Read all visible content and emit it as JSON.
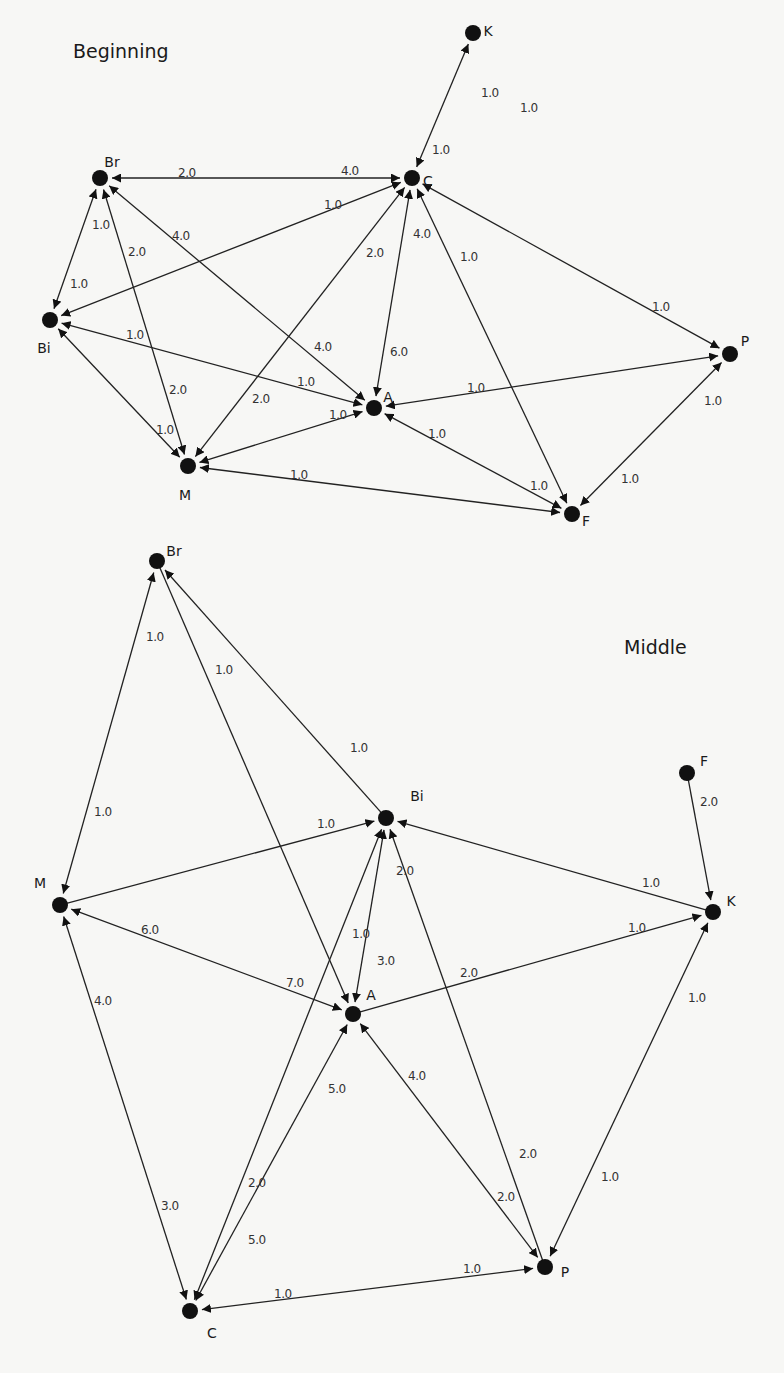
{
  "colors": {
    "background": "#f7f7f5",
    "node": "#111111",
    "edge": "#222222",
    "text": "#1a1a1a"
  },
  "graphs": [
    {
      "title": "Beginning",
      "title_pos": [
        73,
        58
      ],
      "nodes": [
        {
          "id": "K",
          "x": 473,
          "y": 33,
          "lx": 488,
          "ly": 36
        },
        {
          "id": "C",
          "x": 412,
          "y": 178,
          "lx": 428,
          "ly": 186
        },
        {
          "id": "Br",
          "x": 100,
          "y": 178,
          "lx": 112,
          "ly": 167
        },
        {
          "id": "Bi",
          "x": 50,
          "y": 320,
          "lx": 44,
          "ly": 353
        },
        {
          "id": "A",
          "x": 374,
          "y": 408,
          "lx": 388,
          "ly": 402
        },
        {
          "id": "M",
          "x": 188,
          "y": 466,
          "lx": 185,
          "ly": 500
        },
        {
          "id": "P",
          "x": 730,
          "y": 354,
          "lx": 745,
          "ly": 346
        },
        {
          "id": "F",
          "x": 572,
          "y": 514,
          "lx": 586,
          "ly": 526
        }
      ],
      "edges": [
        {
          "from": "C",
          "to": "K",
          "arrowFrom": true,
          "arrowTo": true,
          "labels": [
            {
              "text": "1.0",
              "x": 481,
              "y": 93
            },
            {
              "text": "1.0",
              "x": 432,
              "y": 150
            }
          ]
        },
        {
          "from": "Br",
          "to": "C",
          "arrowFrom": true,
          "arrowTo": true,
          "labels": [
            {
              "text": "2.0",
              "x": 178,
              "y": 173
            },
            {
              "text": "4.0",
              "x": 341,
              "y": 171
            }
          ]
        },
        {
          "from": "Bi",
          "to": "C",
          "arrowFrom": true,
          "arrowTo": true,
          "labels": [
            {
              "text": "1.0",
              "x": 324,
              "y": 205
            }
          ]
        },
        {
          "from": "Bi",
          "to": "Br",
          "arrowFrom": true,
          "arrowTo": true,
          "labels": [
            {
              "text": "1.0",
              "x": 92,
              "y": 225
            },
            {
              "text": "1.0",
              "x": 70,
              "y": 284
            }
          ]
        },
        {
          "from": "M",
          "to": "Br",
          "arrowFrom": true,
          "arrowTo": true,
          "labels": [
            {
              "text": "2.0",
              "x": 128,
              "y": 252
            },
            {
              "text": "2.0",
              "x": 169,
              "y": 390
            }
          ]
        },
        {
          "from": "A",
          "to": "Br",
          "arrowFrom": true,
          "arrowTo": true,
          "labels": [
            {
              "text": "4.0",
              "x": 172,
              "y": 236
            },
            {
              "text": "4.0",
              "x": 314,
              "y": 347
            }
          ]
        },
        {
          "from": "A",
          "to": "Bi",
          "arrowFrom": true,
          "arrowTo": true,
          "labels": [
            {
              "text": "1.0",
              "x": 126,
              "y": 335
            },
            {
              "text": "1.0",
              "x": 297,
              "y": 382
            }
          ]
        },
        {
          "from": "M",
          "to": "Bi",
          "arrowFrom": true,
          "arrowTo": true,
          "labels": [
            {
              "text": "1.0",
              "x": 156,
              "y": 430
            }
          ]
        },
        {
          "from": "M",
          "to": "C",
          "arrowFrom": true,
          "arrowTo": true,
          "labels": [
            {
              "text": "2.0",
              "x": 366,
              "y": 253
            },
            {
              "text": "2.0",
              "x": 252,
              "y": 399
            }
          ]
        },
        {
          "from": "A",
          "to": "C",
          "arrowFrom": true,
          "arrowTo": true,
          "labels": [
            {
              "text": "4.0",
              "x": 413,
              "y": 234
            },
            {
              "text": "6.0",
              "x": 390,
              "y": 352
            }
          ]
        },
        {
          "from": "C",
          "to": "F",
          "arrowFrom": true,
          "arrowTo": true,
          "labels": [
            {
              "text": "1.0",
              "x": 460,
              "y": 257
            }
          ]
        },
        {
          "from": "C",
          "to": "P",
          "arrowFrom": true,
          "arrowTo": true,
          "labels": [
            {
              "text": "1.0",
              "x": 652,
              "y": 307
            }
          ]
        },
        {
          "from": "M",
          "to": "A",
          "arrowFrom": true,
          "arrowTo": true,
          "labels": [
            {
              "text": "1.0",
              "x": 329,
              "y": 415
            }
          ]
        },
        {
          "from": "A",
          "to": "P",
          "arrowFrom": true,
          "arrowTo": true,
          "labels": [
            {
              "text": "1.0",
              "x": 467,
              "y": 388
            }
          ]
        },
        {
          "from": "A",
          "to": "F",
          "arrowFrom": true,
          "arrowTo": true,
          "labels": [
            {
              "text": "1.0",
              "x": 428,
              "y": 434
            },
            {
              "text": "1.0",
              "x": 530,
              "y": 486
            }
          ]
        },
        {
          "from": "M",
          "to": "F",
          "arrowFrom": true,
          "arrowTo": true,
          "labels": [
            {
              "text": "1.0",
              "x": 290,
              "y": 475
            }
          ]
        },
        {
          "from": "F",
          "to": "P",
          "arrowFrom": true,
          "arrowTo": true,
          "labels": [
            {
              "text": "1.0",
              "x": 704,
              "y": 401
            },
            {
              "text": "1.0",
              "x": 621,
              "y": 479
            }
          ]
        }
      ],
      "floating_labels": [
        {
          "text": "1.0",
          "x": 520,
          "y": 112
        }
      ]
    },
    {
      "title": "Middle",
      "title_pos": [
        624,
        654
      ],
      "nodes": [
        {
          "id": "Br",
          "x": 157,
          "y": 561,
          "lx": 174,
          "ly": 556
        },
        {
          "id": "Bi",
          "x": 386,
          "y": 818,
          "lx": 417,
          "ly": 801
        },
        {
          "id": "M",
          "x": 60,
          "y": 905,
          "lx": 40,
          "ly": 888
        },
        {
          "id": "A",
          "x": 353,
          "y": 1014,
          "lx": 371,
          "ly": 1000
        },
        {
          "id": "K",
          "x": 713,
          "y": 912,
          "lx": 731,
          "ly": 906
        },
        {
          "id": "F",
          "x": 687,
          "y": 773,
          "lx": 704,
          "ly": 766
        },
        {
          "id": "C",
          "x": 190,
          "y": 1311,
          "lx": 212,
          "ly": 1338
        },
        {
          "id": "P",
          "x": 545,
          "y": 1267,
          "lx": 565,
          "ly": 1277
        }
      ],
      "edges": [
        {
          "from": "M",
          "to": "Br",
          "arrowFrom": true,
          "arrowTo": true,
          "labels": [
            {
              "text": "1.0",
              "x": 146,
              "y": 637
            },
            {
              "text": "1.0",
              "x": 94,
              "y": 812
            }
          ]
        },
        {
          "from": "Br",
          "to": "A",
          "arrowFrom": false,
          "arrowTo": true,
          "labels": [
            {
              "text": "1.0",
              "x": 215,
              "y": 670
            }
          ]
        },
        {
          "from": "Bi",
          "to": "Br",
          "arrowFrom": false,
          "arrowTo": true,
          "labels": [
            {
              "text": "1.0",
              "x": 350,
              "y": 748
            }
          ]
        },
        {
          "from": "M",
          "to": "Bi",
          "arrowFrom": false,
          "arrowTo": true,
          "labels": [
            {
              "text": "1.0",
              "x": 317,
              "y": 824
            }
          ]
        },
        {
          "from": "K",
          "to": "Bi",
          "arrowFrom": false,
          "arrowTo": true,
          "labels": [
            {
              "text": "1.0",
              "x": 642,
              "y": 883
            }
          ]
        },
        {
          "from": "F",
          "to": "K",
          "arrowFrom": false,
          "arrowTo": true,
          "labels": [
            {
              "text": "2.0",
              "x": 700,
              "y": 802
            }
          ]
        },
        {
          "from": "A",
          "to": "Bi",
          "arrowFrom": true,
          "arrowTo": true,
          "labels": [
            {
              "text": "2.0",
              "x": 396,
              "y": 871
            },
            {
              "text": "3.0",
              "x": 377,
              "y": 961
            }
          ]
        },
        {
          "from": "C",
          "to": "Bi",
          "arrowFrom": true,
          "arrowTo": true,
          "labels": [
            {
              "text": "1.0",
              "x": 352,
              "y": 934
            },
            {
              "text": "2.0",
              "x": 248,
              "y": 1183
            }
          ]
        },
        {
          "from": "M",
          "to": "A",
          "arrowFrom": true,
          "arrowTo": true,
          "labels": [
            {
              "text": "6.0",
              "x": 141,
              "y": 930
            },
            {
              "text": "7.0",
              "x": 286,
              "y": 983
            }
          ]
        },
        {
          "from": "A",
          "to": "K",
          "arrowFrom": false,
          "arrowTo": true,
          "labels": [
            {
              "text": "2.0",
              "x": 460,
              "y": 973
            },
            {
              "text": "1.0",
              "x": 628,
              "y": 928
            }
          ]
        },
        {
          "from": "C",
          "to": "A",
          "arrowFrom": true,
          "arrowTo": true,
          "labels": [
            {
              "text": "5.0",
              "x": 328,
              "y": 1089
            },
            {
              "text": "5.0",
              "x": 248,
              "y": 1240
            }
          ]
        },
        {
          "from": "M",
          "to": "C",
          "arrowFrom": true,
          "arrowTo": true,
          "labels": [
            {
              "text": "4.0",
              "x": 94,
              "y": 1001
            },
            {
              "text": "3.0",
              "x": 161,
              "y": 1206
            }
          ]
        },
        {
          "from": "P",
          "to": "A",
          "arrowFrom": true,
          "arrowTo": true,
          "labels": [
            {
              "text": "4.0",
              "x": 408,
              "y": 1076
            },
            {
              "text": "2.0",
              "x": 497,
              "y": 1197
            }
          ]
        },
        {
          "from": "P",
          "to": "Bi",
          "arrowFrom": false,
          "arrowTo": true,
          "labels": [
            {
              "text": "2.0",
              "x": 519,
              "y": 1154
            }
          ]
        },
        {
          "from": "K",
          "to": "P",
          "arrowFrom": true,
          "arrowTo": true,
          "labels": [
            {
              "text": "1.0",
              "x": 688,
              "y": 998
            },
            {
              "text": "1.0",
              "x": 601,
              "y": 1177
            }
          ]
        },
        {
          "from": "C",
          "to": "P",
          "arrowFrom": true,
          "arrowTo": true,
          "labels": [
            {
              "text": "1.0",
              "x": 274,
              "y": 1294
            },
            {
              "text": "1.0",
              "x": 463,
              "y": 1269
            }
          ]
        }
      ],
      "floating_labels": []
    }
  ]
}
